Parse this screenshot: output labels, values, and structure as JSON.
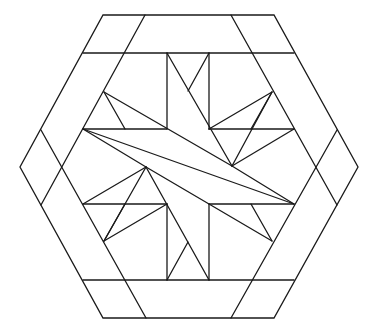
{
  "diagram": {
    "line_color": "#1a1a1a",
    "fill_color": "#f4f4f4",
    "background": "#ffffff",
    "outer_hexagon": [
      [
        103,
        15
      ],
      [
        274,
        15
      ],
      [
        358,
        167
      ],
      [
        274,
        318
      ],
      [
        103,
        318
      ],
      [
        20,
        167
      ]
    ],
    "segments": [
      [
        [
          83,
          53
        ],
        [
          294,
          53
        ]
      ],
      [
        [
          83,
          280
        ],
        [
          294,
          280
        ]
      ],
      [
        [
          145,
          15
        ],
        [
          41,
          205
        ]
      ],
      [
        [
          41,
          130
        ],
        [
          146,
          318
        ]
      ],
      [
        [
          231,
          15
        ],
        [
          337,
          205
        ]
      ],
      [
        [
          337,
          130
        ],
        [
          231,
          318
        ]
      ],
      [
        [
          167,
          53
        ],
        [
          167,
          129
        ]
      ],
      [
        [
          209,
          53
        ],
        [
          209,
          129
        ]
      ],
      [
        [
          167,
          204
        ],
        [
          167,
          280
        ]
      ],
      [
        [
          209,
          204
        ],
        [
          209,
          280
        ]
      ],
      [
        [
          83,
          129
        ],
        [
          167,
          129
        ]
      ],
      [
        [
          209,
          129
        ],
        [
          294,
          129
        ]
      ],
      [
        [
          83,
          204
        ],
        [
          167,
          204
        ]
      ],
      [
        [
          209,
          204
        ],
        [
          294,
          204
        ]
      ],
      [
        [
          83,
          129
        ],
        [
          294,
          204
        ]
      ],
      [
        [
          104,
          92
        ],
        [
          232,
          166
        ]
      ],
      [
        [
          146,
          167
        ],
        [
          272,
          241
        ]
      ],
      [
        [
          104,
          92
        ],
        [
          125,
          129
        ]
      ],
      [
        [
          272,
          241
        ],
        [
          251,
          204
        ]
      ],
      [
        [
          167,
          53
        ],
        [
          232,
          166
        ]
      ],
      [
        [
          209,
          53
        ],
        [
          188,
          91
        ]
      ],
      [
        [
          146,
          167
        ],
        [
          209,
          280
        ]
      ],
      [
        [
          167,
          280
        ],
        [
          188,
          242
        ]
      ],
      [
        [
          272,
          92
        ],
        [
          209,
          129
        ]
      ],
      [
        [
          272,
          92
        ],
        [
          232,
          166
        ]
      ],
      [
        [
          272,
          92
        ],
        [
          251,
          129
        ]
      ],
      [
        [
          104,
          241
        ],
        [
          167,
          204
        ]
      ],
      [
        [
          104,
          241
        ],
        [
          146,
          167
        ]
      ],
      [
        [
          104,
          241
        ],
        [
          125,
          204
        ]
      ],
      [
        [
          83,
          129
        ],
        [
          146,
          167
        ]
      ],
      [
        [
          294,
          204
        ],
        [
          232,
          166
        ]
      ],
      [
        [
          294,
          129
        ],
        [
          232,
          166
        ]
      ],
      [
        [
          83,
          204
        ],
        [
          146,
          167
        ]
      ]
    ]
  }
}
